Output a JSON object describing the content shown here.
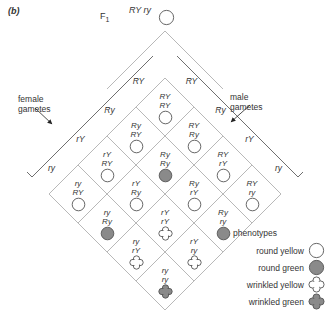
{
  "panel": {
    "label": "(b)"
  },
  "f1": {
    "label": "F",
    "subscript": "1",
    "allele_top": "RY",
    "allele_bottom": "ry",
    "symbol": "round-yellow"
  },
  "axes": {
    "female_label_line1": "female",
    "female_label_line2": "gametes",
    "male_label_line1": "male",
    "male_label_line2": "gametes"
  },
  "gametes": {
    "female": [
      "RY",
      "Ry",
      "rY",
      "ry"
    ],
    "male": [
      "RY",
      "Ry",
      "rY",
      "ry"
    ]
  },
  "colors": {
    "fill_gray": "#8a8a8a",
    "outline": "#555555",
    "grid_line": "#9a9a9a",
    "text": "#333333"
  },
  "legend": {
    "title": "phenotypes",
    "items": [
      {
        "label": "round yellow",
        "symbol": "round-yellow"
      },
      {
        "label": "round green",
        "symbol": "round-green"
      },
      {
        "label": "wrinkled yellow",
        "symbol": "wrinkled-yellow"
      },
      {
        "label": "wrinkled green",
        "symbol": "wrinkled-green"
      }
    ]
  },
  "punnett": {
    "rows": [
      [
        {
          "female": "RY",
          "male": "RY",
          "genotype_top": "RY",
          "genotype_bottom": "RY",
          "symbol": "round-yellow"
        }
      ],
      [
        {
          "female": "Ry",
          "male": "RY",
          "genotype_top": "Ry",
          "genotype_bottom": "RY",
          "symbol": "round-yellow"
        },
        {
          "female": "RY",
          "male": "Ry",
          "genotype_top": "RY",
          "genotype_bottom": "Ry",
          "symbol": "round-yellow"
        }
      ],
      [
        {
          "female": "rY",
          "male": "RY",
          "genotype_top": "rY",
          "genotype_bottom": "RY",
          "symbol": "round-yellow"
        },
        {
          "female": "Ry",
          "male": "Ry",
          "genotype_top": "Ry",
          "genotype_bottom": "Ry",
          "symbol": "round-green"
        },
        {
          "female": "RY",
          "male": "rY",
          "genotype_top": "RY",
          "genotype_bottom": "rY",
          "symbol": "round-yellow"
        }
      ],
      [
        {
          "female": "ry",
          "male": "RY",
          "genotype_top": "ry",
          "genotype_bottom": "RY",
          "symbol": "round-yellow"
        },
        {
          "female": "rY",
          "male": "Ry",
          "genotype_top": "rY",
          "genotype_bottom": "Ry",
          "symbol": "round-yellow"
        },
        {
          "female": "Ry",
          "male": "rY",
          "genotype_top": "Ry",
          "genotype_bottom": "rY",
          "symbol": "round-yellow"
        },
        {
          "female": "RY",
          "male": "ry",
          "genotype_top": "RY",
          "genotype_bottom": "ry",
          "symbol": "round-yellow"
        }
      ],
      [
        {
          "female": "ry",
          "male": "Ry",
          "genotype_top": "ry",
          "genotype_bottom": "Ry",
          "symbol": "round-green"
        },
        {
          "female": "rY",
          "male": "rY",
          "genotype_top": "rY",
          "genotype_bottom": "rY",
          "symbol": "wrinkled-yellow"
        },
        {
          "female": "Ry",
          "male": "ry",
          "genotype_top": "Ry",
          "genotype_bottom": "ry",
          "symbol": "round-green"
        }
      ],
      [
        {
          "female": "ry",
          "male": "rY",
          "genotype_top": "ry",
          "genotype_bottom": "rY",
          "symbol": "wrinkled-yellow"
        },
        {
          "female": "rY",
          "male": "ry",
          "genotype_top": "rY",
          "genotype_bottom": "ry",
          "symbol": "wrinkled-yellow"
        }
      ],
      [
        {
          "female": "ry",
          "male": "ry",
          "genotype_top": "ry",
          "genotype_bottom": "ry",
          "symbol": "wrinkled-green"
        }
      ]
    ]
  }
}
